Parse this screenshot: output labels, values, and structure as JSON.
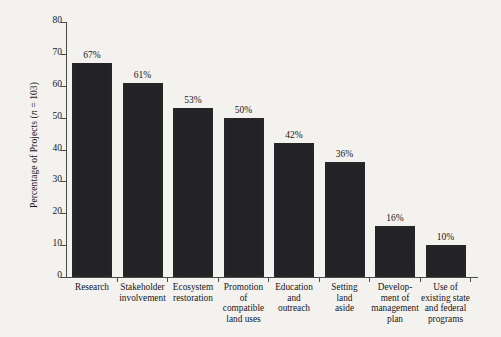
{
  "chart_data": {
    "type": "bar",
    "title": "",
    "subtitle": "",
    "xlabel": "",
    "ylabel": "Percentage of Projects (n = 103)",
    "ylabel_parts": {
      "prefix": "Percentage of Projects (",
      "italic": "n",
      "suffix": " = 103)"
    },
    "sample_size": 103,
    "categories": [
      "Research",
      "Stakeholder involvement",
      "Ecosystem restoration",
      "Promotion of compatible land uses",
      "Education and outreach",
      "Setting land aside",
      "Development of management plan",
      "Use of existing state and federal programs"
    ],
    "category_label_lines": [
      [
        "Research"
      ],
      [
        "Stakeholder",
        "involvement"
      ],
      [
        "Ecosystem",
        "restoration"
      ],
      [
        "Promotion",
        "of",
        "compatible",
        "land uses"
      ],
      [
        "Education",
        "and",
        "outreach"
      ],
      [
        "Setting",
        "land",
        "aside"
      ],
      [
        "Develop-",
        "ment of",
        "management",
        "plan"
      ],
      [
        "Use of",
        "existing state",
        "and federal",
        "programs"
      ]
    ],
    "values": [
      67,
      61,
      53,
      50,
      42,
      36,
      16,
      10
    ],
    "value_labels": [
      "67%",
      "61%",
      "53%",
      "50%",
      "42%",
      "36%",
      "16%",
      "10%"
    ],
    "ylim": [
      0,
      80
    ],
    "ytick_values": [
      0,
      10,
      20,
      30,
      40,
      50,
      60,
      70,
      80
    ],
    "ytick_labels": [
      "0",
      "10",
      "20",
      "30",
      "40",
      "50",
      "60",
      "70",
      "80"
    ],
    "grid": false,
    "legend": false,
    "legend_position": "none",
    "bar_color": "#232326",
    "axis_color": "#4a4a4a",
    "text_color": "#17161a",
    "background_color": "#f4f2ef"
  }
}
